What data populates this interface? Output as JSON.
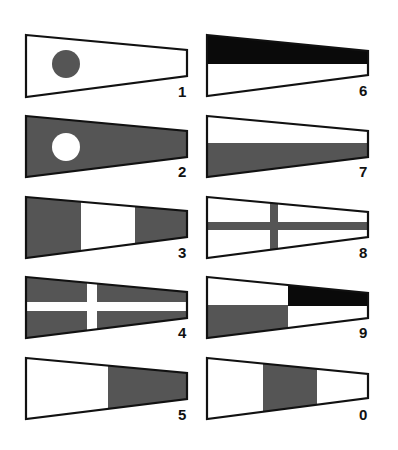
{
  "colors": {
    "outline": "#111111",
    "dark": "#555555",
    "black": "#0a0a0a",
    "white": "#ffffff"
  },
  "flags": [
    {
      "label": "1",
      "pattern": "white field with dark circle"
    },
    {
      "label": "2",
      "pattern": "dark field with white circle"
    },
    {
      "label": "3",
      "pattern": "dark, white, dark vertical thirds"
    },
    {
      "label": "4",
      "pattern": "dark field with white cross"
    },
    {
      "label": "5",
      "pattern": "white hoist, dark fly"
    },
    {
      "label": "6",
      "pattern": "black over white horizontal halves"
    },
    {
      "label": "7",
      "pattern": "white over dark horizontal halves"
    },
    {
      "label": "8",
      "pattern": "white field with dark cross"
    },
    {
      "label": "9",
      "pattern": "quartered: white/black top, dark/white bottom"
    },
    {
      "label": "0",
      "pattern": "white, dark, white vertical thirds"
    }
  ]
}
